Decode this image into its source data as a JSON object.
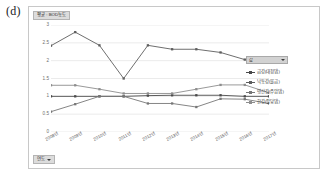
{
  "panel": {
    "label": "(d)"
  },
  "colors": {
    "series_1": "#4a4a4a",
    "series_2": "#5e5e5e",
    "series_3": "#777777",
    "series_4": "#8d8d8d",
    "gridline": "#e3e3e3",
    "axis_text": "#6e6e6e",
    "field_button_bg": "#dcdcdc",
    "frame_border": "#c8c8c8"
  },
  "value_field_button": {
    "label": "평균 : BOD농도"
  },
  "axis_field_button": {
    "label": "연도",
    "caret": "chevron-down-icon"
  },
  "legend_filter_button": {
    "label": "값",
    "caret": "chevron-down-icon"
  },
  "chart_data": {
    "type": "line",
    "title": "평균 : BOD농도",
    "xlabel": "연도",
    "ylabel": "",
    "ylim": [
      0,
      3
    ],
    "yticks": [
      "0",
      "0.5",
      "1",
      "1.5",
      "2",
      "2.5",
      "3"
    ],
    "ytick_values": [
      0,
      0.5,
      1,
      1.5,
      2,
      2.5,
      3
    ],
    "grid": true,
    "legend_position": "right",
    "categories": [
      "2008년",
      "2009년",
      "2010년",
      "2011년",
      "2012년",
      "2013년",
      "2014년",
      "2015년",
      "2016년",
      "2017년"
    ],
    "series": [
      {
        "name": "금강(대청댐)",
        "values": [
          1.0,
          1.0,
          1.0,
          1.0,
          1.02,
          1.03,
          1.03,
          1.03,
          1.0,
          1.0
        ]
      },
      {
        "name": "낙동강(물금)",
        "values": [
          2.42,
          2.8,
          2.43,
          1.5,
          2.43,
          2.32,
          2.32,
          2.23,
          2.03,
          2.04
        ]
      },
      {
        "name": "영산강(주암댐)",
        "values": [
          0.57,
          0.78,
          1.0,
          1.0,
          0.8,
          0.8,
          0.7,
          0.93,
          0.92,
          0.8
        ]
      },
      {
        "name": "한강(팔당댐)",
        "values": [
          1.31,
          1.31,
          1.2,
          1.08,
          1.08,
          1.08,
          1.2,
          1.32,
          1.32,
          1.1
        ]
      }
    ]
  }
}
